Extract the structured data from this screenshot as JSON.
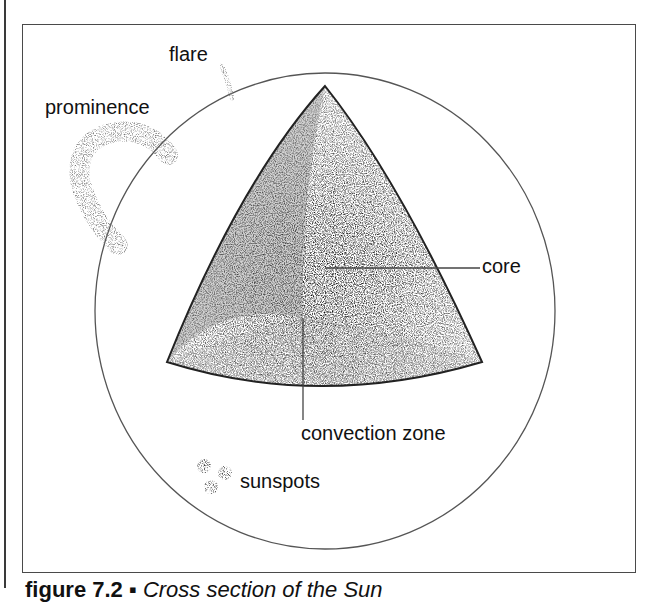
{
  "figure": {
    "labels": {
      "flare": "flare",
      "prominence": "prominence",
      "core": "core",
      "convection_zone": "convection zone",
      "sunspots": "sunspots"
    },
    "caption": {
      "number": "figure 7.2",
      "bullet": "▪",
      "text": "Cross section of the Sun"
    }
  }
}
